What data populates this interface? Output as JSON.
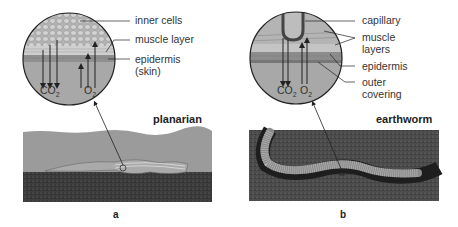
{
  "panels": [
    {
      "id": "a",
      "letter": "a",
      "organism": "planarian",
      "labels": [
        "inner cells",
        "muscle layer",
        "epidermis",
        "(skin)"
      ],
      "gases": {
        "out": "CO",
        "out_sub": "2",
        "in": "O",
        "in_sub": "2"
      }
    },
    {
      "id": "b",
      "letter": "b",
      "organism": "earthworm",
      "labels": [
        "capillary",
        "muscle",
        "layers",
        "epidermis",
        "outer",
        "covering"
      ],
      "gases": {
        "out": "CO",
        "out_sub": "2",
        "in": "O",
        "in_sub": "2"
      }
    }
  ],
  "colors": {
    "water": "#9a9a9a",
    "soil": "#3c3c3c",
    "circle_fill": "#a9a9a9",
    "cells": "#bdbdbd",
    "muscle": "#c8c8c8",
    "epidermis": "#8e8e8e",
    "arrow": "#222222"
  }
}
